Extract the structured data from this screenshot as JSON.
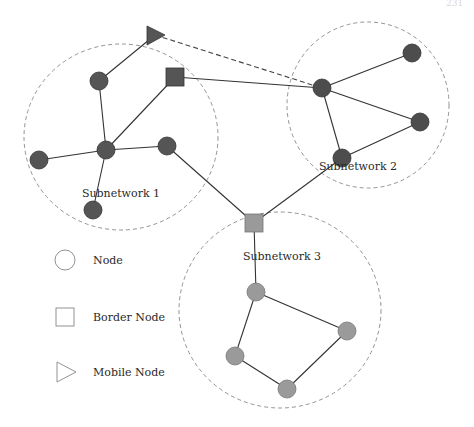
{
  "header": {
    "page_number": "231"
  },
  "colors": {
    "subnet1_node": "#555555",
    "subnet2_node": "#4d4d4d",
    "subnet3_node": "#9a9a9a",
    "border_node_1": "#555555",
    "border_node_3": "#9a9a9a",
    "mobile_node": "#555555",
    "edge": "#333333",
    "boundary": "#888888"
  },
  "subnetworks": [
    {
      "id": "s1",
      "label": "Subnetwork 1",
      "cx": 121,
      "cy": 137,
      "rx": 97,
      "ry": 93,
      "label_x": 121,
      "label_y": 197
    },
    {
      "id": "s2",
      "label": "Subnetwork 2",
      "cx": 368,
      "cy": 105,
      "rx": 81,
      "ry": 83,
      "label_x": 358,
      "label_y": 170
    },
    {
      "id": "s3",
      "label": "Subnetwork 3",
      "cx": 280,
      "cy": 310,
      "rx": 101,
      "ry": 98,
      "label_x": 282,
      "label_y": 260
    }
  ],
  "nodes": [
    {
      "id": "n1a",
      "type": "node",
      "x": 99,
      "y": 81,
      "subnet": "s1"
    },
    {
      "id": "n1b",
      "type": "node",
      "x": 106,
      "y": 150,
      "subnet": "s1"
    },
    {
      "id": "n1c",
      "type": "node",
      "x": 39,
      "y": 160,
      "subnet": "s1"
    },
    {
      "id": "n1d",
      "type": "node",
      "x": 93,
      "y": 210,
      "subnet": "s1"
    },
    {
      "id": "n1e",
      "type": "node",
      "x": 167,
      "y": 146,
      "subnet": "s1"
    },
    {
      "id": "b1",
      "type": "border",
      "x": 175,
      "y": 77,
      "subnet": "s1"
    },
    {
      "id": "m1",
      "type": "mobile",
      "x": 155,
      "y": 35
    },
    {
      "id": "n2a",
      "type": "node",
      "x": 322,
      "y": 88,
      "subnet": "s2"
    },
    {
      "id": "n2b",
      "type": "node",
      "x": 412,
      "y": 53,
      "subnet": "s2"
    },
    {
      "id": "n2c",
      "type": "node",
      "x": 420,
      "y": 122,
      "subnet": "s2"
    },
    {
      "id": "n2d",
      "type": "node",
      "x": 342,
      "y": 158,
      "subnet": "s2"
    },
    {
      "id": "b3",
      "type": "border",
      "x": 254,
      "y": 223,
      "subnet": "s3"
    },
    {
      "id": "n3a",
      "type": "node",
      "x": 256,
      "y": 292,
      "subnet": "s3"
    },
    {
      "id": "n3b",
      "type": "node",
      "x": 347,
      "y": 331,
      "subnet": "s3"
    },
    {
      "id": "n3c",
      "type": "node",
      "x": 235,
      "y": 356,
      "subnet": "s3"
    },
    {
      "id": "n3d",
      "type": "node",
      "x": 287,
      "y": 389,
      "subnet": "s3"
    }
  ],
  "edges": [
    {
      "from": "m1",
      "to": "n1a",
      "style": "solid"
    },
    {
      "from": "m1",
      "to": "n2a",
      "style": "dashed"
    },
    {
      "from": "n1a",
      "to": "n1b",
      "style": "solid"
    },
    {
      "from": "n1b",
      "to": "b1",
      "style": "solid"
    },
    {
      "from": "n1b",
      "to": "n1c",
      "style": "solid"
    },
    {
      "from": "n1b",
      "to": "n1d",
      "style": "solid"
    },
    {
      "from": "n1b",
      "to": "n1e",
      "style": "solid"
    },
    {
      "from": "b1",
      "to": "n2a",
      "style": "solid"
    },
    {
      "from": "n1e",
      "to": "b3",
      "style": "solid"
    },
    {
      "from": "n2a",
      "to": "n2b",
      "style": "solid"
    },
    {
      "from": "n2a",
      "to": "n2c",
      "style": "solid"
    },
    {
      "from": "n2a",
      "to": "n2d",
      "style": "solid"
    },
    {
      "from": "n2c",
      "to": "n2d",
      "style": "solid"
    },
    {
      "from": "n2d",
      "to": "b3",
      "style": "solid"
    },
    {
      "from": "b3",
      "to": "n3a",
      "style": "solid"
    },
    {
      "from": "n3a",
      "to": "n3b",
      "style": "solid"
    },
    {
      "from": "n3a",
      "to": "n3c",
      "style": "solid"
    },
    {
      "from": "n3c",
      "to": "n3d",
      "style": "solid"
    },
    {
      "from": "n3d",
      "to": "n3b",
      "style": "solid"
    }
  ],
  "legend": {
    "items": [
      {
        "shape": "circle",
        "label": "Node",
        "x": 65,
        "y": 260
      },
      {
        "shape": "square",
        "label": "Border Node",
        "x": 65,
        "y": 317
      },
      {
        "shape": "triangle",
        "label": "Mobile Node",
        "x": 65,
        "y": 372
      }
    ]
  }
}
